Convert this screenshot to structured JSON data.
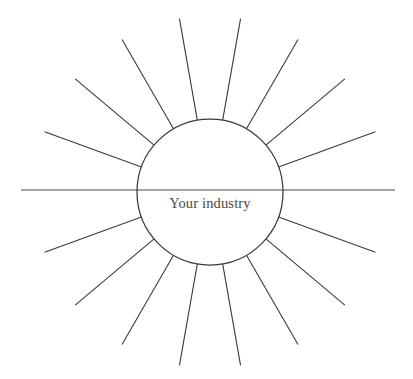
{
  "diagram": {
    "type": "radial-sunburst-brainstorm-template",
    "background_color": "#ffffff",
    "line_color": "#3a3a3a",
    "text_color": "#4a4a4a",
    "hub": {
      "label": "Your industry",
      "center_x": 210,
      "center_y": 192,
      "radius": 73,
      "divider_y": 190
    },
    "axis": {
      "left_end_x": 21,
      "right_end_x": 395,
      "y": 190
    },
    "rays": {
      "count": 18,
      "angle_step_degrees": 20,
      "inner_radius": 73,
      "outer_radius": 176,
      "angles_degrees": [
        0,
        20,
        40,
        60,
        80,
        100,
        120,
        140,
        160,
        180,
        200,
        220,
        240,
        260,
        280,
        300,
        320,
        340
      ],
      "labels": [
        "",
        "",
        "",
        "",
        "",
        "",
        "",
        "",
        "",
        "",
        "",
        "",
        "",
        "",
        "",
        "",
        "",
        ""
      ]
    }
  }
}
